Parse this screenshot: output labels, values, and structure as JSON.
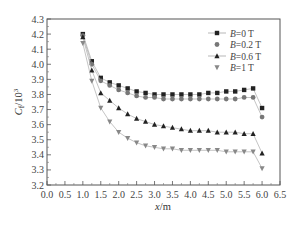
{
  "chart_data": {
    "type": "line",
    "title": "",
    "xlabel": "x/m",
    "ylabel": "C_f/10^3",
    "xlim": [
      0.0,
      6.5
    ],
    "ylim": [
      3.2,
      4.3
    ],
    "grid": false,
    "legend_position": "upper right",
    "x_ticks": [
      "0.0",
      "0.5",
      "1.0",
      "1.5",
      "2.0",
      "2.5",
      "3.0",
      "3.5",
      "4.0",
      "4.5",
      "5.0",
      "5.5",
      "6.0",
      "6.5"
    ],
    "y_ticks": [
      "3.2",
      "3.3",
      "3.4",
      "3.5",
      "3.6",
      "3.7",
      "3.8",
      "3.9",
      "4.0",
      "4.1",
      "4.2",
      "4.3"
    ],
    "x": [
      1.0,
      1.25,
      1.5,
      1.75,
      2.0,
      2.25,
      2.5,
      2.75,
      3.0,
      3.25,
      3.5,
      3.75,
      4.0,
      4.25,
      4.5,
      4.75,
      5.0,
      5.25,
      5.5,
      5.75,
      6.0
    ],
    "series": [
      {
        "name": "B=0 T",
        "marker": "square",
        "color": "#222222",
        "values": [
          4.2,
          4.02,
          3.91,
          3.88,
          3.86,
          3.84,
          3.82,
          3.81,
          3.8,
          3.8,
          3.8,
          3.8,
          3.8,
          3.8,
          3.81,
          3.81,
          3.82,
          3.82,
          3.83,
          3.84,
          3.71
        ]
      },
      {
        "name": "B=0.2 T",
        "marker": "circle",
        "color": "#777777",
        "values": [
          4.19,
          4.0,
          3.89,
          3.86,
          3.83,
          3.81,
          3.79,
          3.78,
          3.78,
          3.77,
          3.77,
          3.77,
          3.77,
          3.77,
          3.77,
          3.77,
          3.77,
          3.77,
          3.78,
          3.78,
          3.65
        ]
      },
      {
        "name": "B=0.6 T",
        "marker": "triangle-up",
        "color": "#222222",
        "values": [
          4.18,
          3.96,
          3.81,
          3.76,
          3.71,
          3.67,
          3.64,
          3.62,
          3.6,
          3.59,
          3.58,
          3.57,
          3.56,
          3.56,
          3.56,
          3.55,
          3.55,
          3.55,
          3.54,
          3.54,
          3.41
        ]
      },
      {
        "name": "B=1 T",
        "marker": "triangle-down",
        "color": "#888888",
        "values": [
          4.14,
          3.89,
          3.71,
          3.62,
          3.55,
          3.51,
          3.48,
          3.46,
          3.45,
          3.44,
          3.44,
          3.43,
          3.43,
          3.43,
          3.43,
          3.43,
          3.42,
          3.42,
          3.42,
          3.42,
          3.31
        ]
      }
    ]
  },
  "axis": {
    "x_title_italic": "x",
    "x_title_unit": "/m",
    "y_title_italic": "C",
    "y_title_sub": "f",
    "y_title_unit": "/10",
    "y_title_sup": "3"
  },
  "legend": {
    "items": [
      {
        "italic": "B",
        "rest": "=0 T"
      },
      {
        "italic": "B",
        "rest": "=0.2 T"
      },
      {
        "italic": "B",
        "rest": "=0.6 T"
      },
      {
        "italic": "B",
        "rest": "=1 T"
      }
    ]
  }
}
